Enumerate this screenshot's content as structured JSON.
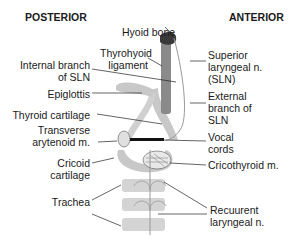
{
  "headers": {
    "posterior": "POSTERIOR",
    "anterior": "ANTERIOR"
  },
  "left_labels": {
    "internal_branch_1": "Internal branch",
    "internal_branch_2": "of SLN",
    "epiglottis": "Epiglottis",
    "thyroid_cartilage": "Thyroid cartilage",
    "transverse_1": "Transverse",
    "transverse_2": "arytenoid m.",
    "cricoid_1": "Cricoid",
    "cricoid_2": "cartilage",
    "trachea": "Trachea"
  },
  "center_labels": {
    "hyoid": "Hyoid bone",
    "thyrohyoid_1": "Thyrohyoid",
    "thyrohyoid_2": "ligament"
  },
  "right_labels": {
    "sln_1": "Superior",
    "sln_2": "laryngeal n.",
    "sln_3": "(SLN)",
    "ext_1": "External",
    "ext_2": "branch of",
    "ext_3": "SLN",
    "vocal_1": "Vocal",
    "vocal_2": "cords",
    "cricothyroid": "Cricothyroid m.",
    "recurrent_1": "Recuurent",
    "recurrent_2": "laryngeal n."
  },
  "colors": {
    "cartilage": "#c8c8c8",
    "hyoid": "#3a3a3a",
    "ligament": "#8a8a8a",
    "nerve": "#9a9a9a",
    "line": "#222222"
  }
}
